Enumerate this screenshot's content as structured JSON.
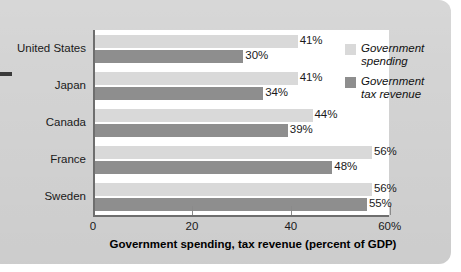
{
  "chart_data": {
    "type": "bar",
    "orientation": "horizontal",
    "title": "",
    "xlabel": "Government spending, tax revenue (percent of GDP)",
    "ylabel": "",
    "categories": [
      "United States",
      "Japan",
      "Canada",
      "France",
      "Sweden"
    ],
    "series": [
      {
        "name": "Government spending",
        "color": "#d9d9d9",
        "values": [
          41,
          41,
          44,
          56,
          56
        ],
        "labels": [
          "41%",
          "41%",
          "44%",
          "56%",
          "56%"
        ]
      },
      {
        "name": "Government tax revenue",
        "color": "#8e8e8e",
        "values": [
          30,
          34,
          39,
          48,
          55
        ],
        "labels": [
          "30%",
          "34%",
          "39%",
          "48%",
          "55%"
        ]
      }
    ],
    "xlim": [
      0,
      62
    ],
    "xticks": [
      0,
      20,
      40,
      60
    ],
    "xtick_labels": [
      "0",
      "20",
      "40",
      "60%"
    ],
    "grid": false,
    "legend_position": "top-right"
  },
  "legend": {
    "items": [
      {
        "label_line1": "Government",
        "label_line2": "spending"
      },
      {
        "label_line1": "Government",
        "label_line2": "tax revenue"
      }
    ]
  },
  "colors": {
    "panel_background": "#d3d3d3",
    "plot_background": "#ffffff",
    "axis": "#6e6e6e",
    "spending": "#d9d9d9",
    "revenue": "#8e8e8e",
    "text": "#1a1a1a"
  }
}
